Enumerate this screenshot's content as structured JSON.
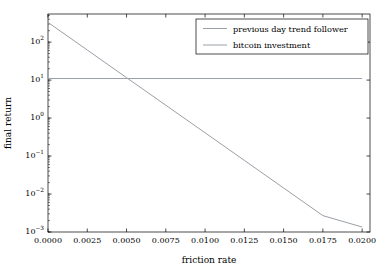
{
  "chart_data": {
    "type": "line",
    "title": "",
    "xlabel": "friction rate",
    "ylabel": "final return",
    "xlim": [
      0.0,
      0.0205
    ],
    "ylim": [
      0.001,
      550
    ],
    "yscale": "log",
    "xscale": "linear",
    "grid": false,
    "legend_position": "upper right",
    "xticks": [
      "0.0000",
      "0.0025",
      "0.0050",
      "0.0075",
      "0.0100",
      "0.0125",
      "0.0150",
      "0.0175",
      "0.0200"
    ],
    "xtick_values": [
      0.0,
      0.0025,
      0.005,
      0.0075,
      0.01,
      0.0125,
      0.015,
      0.0175,
      0.02
    ],
    "yticks": [
      "10²",
      "10¹",
      "10⁰",
      "10⁻¹",
      "10⁻²",
      "10⁻³"
    ],
    "ytick_values": [
      100,
      10,
      1,
      0.1,
      0.01,
      0.001
    ],
    "series": [
      {
        "name": "previous day trend follower",
        "color": "#9aa0a6",
        "linewidth": 1.0,
        "x": [
          0.0,
          0.0025,
          0.005,
          0.0075,
          0.01,
          0.0125,
          0.015,
          0.0175,
          0.02
        ],
        "y": [
          330.0,
          62.0,
          11.6,
          2.18,
          0.41,
          0.077,
          0.0144,
          0.0027,
          0.00135
        ]
      },
      {
        "name": "bitcoin investment",
        "color": "#9aa0a6",
        "linewidth": 1.0,
        "x": [
          0.0,
          0.02
        ],
        "y": [
          11.0,
          11.0
        ]
      }
    ],
    "annotations": []
  },
  "legend": {
    "entries": [
      {
        "label": "previous day trend follower",
        "color": "#9aa0a6"
      },
      {
        "label": "bitcoin investment",
        "color": "#9aa0a6"
      }
    ]
  },
  "axes": {
    "x_title": "friction rate",
    "y_title": "final return",
    "x_tick_labels": [
      "0.0000",
      "0.0025",
      "0.0050",
      "0.0075",
      "0.0100",
      "0.0125",
      "0.0150",
      "0.0175",
      "0.0200"
    ],
    "y_tick_labels": [
      "10²",
      "10¹",
      "10⁰",
      "10⁻¹",
      "10⁻²",
      "10⁻³"
    ]
  },
  "style": {
    "background": "#ffffff",
    "axis_color": "#000000",
    "line_color": "#9aa0a6",
    "legend_border": "#000000"
  }
}
